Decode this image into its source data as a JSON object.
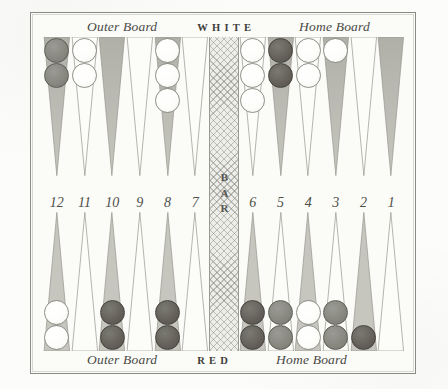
{
  "board": {
    "top_caption": {
      "outer": "Outer Board",
      "player": "WHITE",
      "home": "Home Board"
    },
    "bottom_caption": {
      "outer": "Outer Board",
      "player": "RED",
      "home": "Home Board"
    },
    "bar_label": "BAR",
    "point_numbers_left": [
      "12",
      "11",
      "10",
      "9",
      "8",
      "7"
    ],
    "point_numbers_right": [
      "6",
      "5",
      "4",
      "3",
      "2",
      "1"
    ],
    "colors": {
      "frame": "#8a8a84",
      "paper": "#fcfcfa",
      "point_shaded": "#b3b3ab",
      "point_light": "#fbfbf8",
      "checker_white": "#fdfdfb",
      "checker_red": "#87877f",
      "checker_dark": "#64605 9",
      "bar_fill": "#ededea",
      "text": "#4a4a46"
    },
    "top_row": [
      {
        "number": "12",
        "shaded": true,
        "checkers": [
          "red",
          "red"
        ]
      },
      {
        "number": "11",
        "shaded": false,
        "checkers": [
          "white",
          "white"
        ]
      },
      {
        "number": "10",
        "shaded": true,
        "checkers": []
      },
      {
        "number": "9",
        "shaded": false,
        "checkers": []
      },
      {
        "number": "8",
        "shaded": true,
        "checkers": [
          "white",
          "white",
          "white"
        ]
      },
      {
        "number": "7",
        "shaded": false,
        "checkers": []
      }
    ],
    "top_row_right": [
      {
        "number": "6",
        "shaded": false,
        "checkers": [
          "white",
          "white",
          "white"
        ]
      },
      {
        "number": "5",
        "shaded": true,
        "checkers": [
          "dark",
          "dark"
        ]
      },
      {
        "number": "4",
        "shaded": false,
        "checkers": [
          "white",
          "white"
        ]
      },
      {
        "number": "3",
        "shaded": true,
        "checkers": [
          "white"
        ]
      },
      {
        "number": "2",
        "shaded": false,
        "checkers": []
      },
      {
        "number": "1",
        "shaded": true,
        "checkers": []
      }
    ],
    "bottom_row": [
      {
        "number": "12",
        "shaded": true,
        "checkers": [
          "white",
          "white"
        ]
      },
      {
        "number": "11",
        "shaded": false,
        "checkers": []
      },
      {
        "number": "10",
        "shaded": true,
        "checkers": [
          "dark",
          "dark"
        ]
      },
      {
        "number": "9",
        "shaded": false,
        "checkers": []
      },
      {
        "number": "8",
        "shaded": true,
        "checkers": [
          "dark",
          "dark"
        ]
      },
      {
        "number": "7",
        "shaded": false,
        "checkers": []
      }
    ],
    "bottom_row_right": [
      {
        "number": "6",
        "shaded": true,
        "checkers": [
          "dark",
          "dark"
        ]
      },
      {
        "number": "5",
        "shaded": false,
        "checkers": [
          "red",
          "red"
        ]
      },
      {
        "number": "4",
        "shaded": true,
        "checkers": [
          "white",
          "white"
        ]
      },
      {
        "number": "3",
        "shaded": false,
        "checkers": [
          "red",
          "red"
        ]
      },
      {
        "number": "2",
        "shaded": true,
        "checkers": [
          "dark"
        ]
      },
      {
        "number": "1",
        "shaded": false,
        "checkers": []
      }
    ]
  }
}
